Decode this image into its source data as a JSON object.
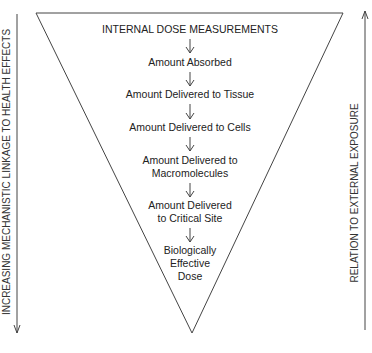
{
  "diagram": {
    "header": "INTERNAL DOSE MEASUREMENTS",
    "steps": [
      {
        "lines": [
          "Amount Absorbed"
        ]
      },
      {
        "lines": [
          "Amount Delivered to Tissue"
        ]
      },
      {
        "lines": [
          "Amount Delivered to Cells"
        ]
      },
      {
        "lines": [
          "Amount Delivered to",
          "Macromolecules"
        ]
      },
      {
        "lines": [
          "Amount Delivered",
          "to Critical Site"
        ]
      },
      {
        "lines": [
          "Biologically",
          "Effective",
          "Dose"
        ]
      }
    ],
    "left_axis_label": "INCREASING MECHANISTIC LINKAGE TO HEALTH EFFECTS",
    "left_axis_direction": "down",
    "right_axis_label": "RELATION TO EXTERNAL EXPOSURE",
    "right_axis_direction": "up",
    "colors": {
      "line": "#444444",
      "text": "#222222",
      "background": "#ffffff"
    }
  }
}
